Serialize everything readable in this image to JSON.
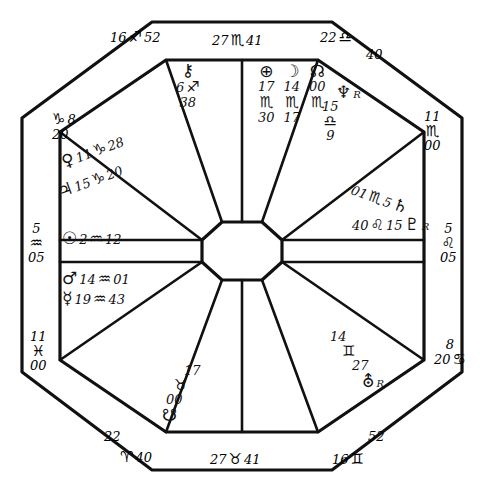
{
  "chart": {
    "type": "astrological-natal-chart",
    "shape": "octagon-square-wheel",
    "houses": 12,
    "outer_cusps": [
      {
        "id": "cusp-top-left",
        "deg": "16",
        "sign_glyph": "♐",
        "sign": "Sagittarius",
        "min": "52"
      },
      {
        "id": "cusp-top-mid",
        "deg": "27",
        "sign_glyph": "♏",
        "sign": "Scorpio",
        "min": "41"
      },
      {
        "id": "cusp-top-right",
        "deg": "22",
        "sign_glyph": "♎",
        "sign": "Libra",
        "min": "40"
      },
      {
        "id": "cusp-upper-left",
        "deg": "8",
        "sign_glyph": "♑",
        "sign": "Capricorn",
        "min": "20"
      },
      {
        "id": "cusp-upper-right",
        "deg": "11",
        "sign_glyph": "♏",
        "sign": "Scorpio",
        "min": "00"
      },
      {
        "id": "cusp-ascendant",
        "deg": "5",
        "sign_glyph": "♒",
        "sign": "Aquarius",
        "min": "05"
      },
      {
        "id": "cusp-descendant",
        "deg": "5",
        "sign_glyph": "♌",
        "sign": "Leo",
        "min": "05"
      },
      {
        "id": "cusp-lower-left",
        "deg": "11",
        "sign_glyph": "♓",
        "sign": "Pisces",
        "min": "00"
      },
      {
        "id": "cusp-lower-right",
        "deg": "8",
        "sign_glyph": "♋",
        "sign": "Cancer",
        "min": "20"
      },
      {
        "id": "cusp-bottom-left",
        "deg": "22",
        "sign_glyph": "♈",
        "sign": "Aries",
        "min": "40"
      },
      {
        "id": "cusp-bottom-mid",
        "deg": "27",
        "sign_glyph": "♉",
        "sign": "Taurus",
        "min": "41"
      },
      {
        "id": "cusp-bottom-right",
        "deg": "16",
        "sign_glyph": "♊",
        "sign": "Gemini",
        "min": "52"
      }
    ],
    "placements": [
      {
        "id": "chiron",
        "name": "Chiron",
        "glyph": "⚷",
        "deg": "6",
        "sign_glyph": "♐",
        "sign": "Sagittarius",
        "min": "38",
        "retrograde": false
      },
      {
        "id": "part-fortune",
        "name": "Part of Fortune",
        "glyph": "⊕",
        "deg": "17",
        "sign_glyph": "♏",
        "sign": "Scorpio",
        "min": "30",
        "retrograde": false
      },
      {
        "id": "moon",
        "name": "Moon",
        "glyph": "☽",
        "deg": "14",
        "sign_glyph": "♏",
        "sign": "Scorpio",
        "min": "17",
        "retrograde": false
      },
      {
        "id": "north-node",
        "name": "North Node",
        "glyph": "☊",
        "deg": "00",
        "sign_glyph": "♏",
        "sign": "Scorpio",
        "min": "",
        "retrograde": false
      },
      {
        "id": "neptune",
        "name": "Neptune",
        "glyph": "♆",
        "deg": "15",
        "sign_glyph": "♎",
        "sign": "Libra",
        "min": "9",
        "retrograde": true
      },
      {
        "id": "saturn",
        "name": "Saturn",
        "glyph": "♄",
        "deg": "01",
        "sign_glyph": "♏",
        "sign": "Scorpio",
        "min": "5",
        "retrograde": false
      },
      {
        "id": "pluto",
        "name": "Pluto",
        "glyph": "♇",
        "deg": "15",
        "sign_glyph": "♌",
        "sign": "Leo",
        "min": "40",
        "retrograde": true
      },
      {
        "id": "uranus",
        "name": "Uranus",
        "glyph": "⛢",
        "deg": "14",
        "sign_glyph": "♊",
        "sign": "Gemini",
        "min": "27",
        "retrograde": true
      },
      {
        "id": "south-node",
        "name": "South Node",
        "glyph": "☋",
        "deg": "17",
        "sign_glyph": "♉",
        "sign": "Taurus",
        "min": "00",
        "retrograde": false
      },
      {
        "id": "venus",
        "name": "Venus",
        "glyph": "♀",
        "deg": "11",
        "sign_glyph": "♑",
        "sign": "Capricorn",
        "min": "28",
        "retrograde": false
      },
      {
        "id": "jupiter",
        "name": "Jupiter",
        "glyph": "♃",
        "deg": "15",
        "sign_glyph": "♑",
        "sign": "Capricorn",
        "min": "20",
        "retrograde": false
      },
      {
        "id": "sun",
        "name": "Sun",
        "glyph": "☉",
        "deg": "2",
        "sign_glyph": "♒",
        "sign": "Aquarius",
        "min": "12",
        "retrograde": false
      },
      {
        "id": "mars",
        "name": "Mars",
        "glyph": "♂",
        "deg": "14",
        "sign_glyph": "♒",
        "sign": "Aquarius",
        "min": "01",
        "retrograde": false
      },
      {
        "id": "mercury",
        "name": "Mercury",
        "glyph": "☿",
        "deg": "19",
        "sign_glyph": "♒",
        "sign": "Aquarius",
        "min": "43",
        "retrograde": false
      }
    ],
    "retrograde_mark": "R",
    "ink_color": "#111111",
    "paper_color": "#ffffff"
  }
}
